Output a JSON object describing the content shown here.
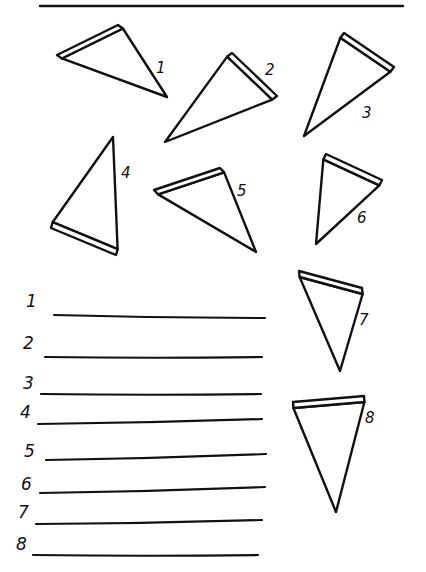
{
  "worksheet": {
    "header_line": {
      "x1": 40,
      "y1": 6,
      "x2": 403,
      "y2": 6
    },
    "ink_color": "#111111",
    "background_color": "#ffffff",
    "slices": [
      {
        "number": "1",
        "crust_a": [
          57,
          55
        ],
        "crust_b": [
          118,
          25
        ],
        "tip": [
          167,
          97
        ],
        "label_pos": [
          156,
          73
        ]
      },
      {
        "number": "2",
        "crust_a": [
          232,
          53
        ],
        "crust_b": [
          277,
          96
        ],
        "tip": [
          165,
          142
        ],
        "label_pos": [
          265,
          75
        ]
      },
      {
        "number": "3",
        "crust_a": [
          344,
          33
        ],
        "crust_b": [
          394,
          67
        ],
        "tip": [
          304,
          136
        ],
        "label_pos": [
          362,
          118
        ]
      },
      {
        "number": "4",
        "crust_a": [
          51,
          228
        ],
        "crust_b": [
          116,
          255
        ],
        "tip": [
          113,
          137
        ],
        "label_pos": [
          121,
          178
        ]
      },
      {
        "number": "5",
        "crust_a": [
          154,
          190
        ],
        "crust_b": [
          220,
          168
        ],
        "tip": [
          256,
          252
        ],
        "label_pos": [
          237,
          196
        ]
      },
      {
        "number": "6",
        "crust_a": [
          326,
          154
        ],
        "crust_b": [
          382,
          180
        ],
        "tip": [
          316,
          244
        ],
        "label_pos": [
          357,
          223
        ]
      },
      {
        "number": "7",
        "crust_a": [
          299,
          271
        ],
        "crust_b": [
          362,
          288
        ],
        "tip": [
          340,
          371
        ],
        "label_pos": [
          359,
          325
        ]
      },
      {
        "number": "8",
        "crust_a": [
          293,
          402
        ],
        "crust_b": [
          364,
          396
        ],
        "tip": [
          336,
          512
        ],
        "label_pos": [
          365,
          423
        ]
      }
    ],
    "answer_lines": [
      {
        "number": "1",
        "label_pos": [
          26,
          307
        ],
        "x1": 54,
        "y1": 315,
        "x2": 265,
        "y2": 318
      },
      {
        "number": "2",
        "label_pos": [
          23,
          349
        ],
        "x1": 45,
        "y1": 357,
        "x2": 262,
        "y2": 357
      },
      {
        "number": "3",
        "label_pos": [
          23,
          389
        ],
        "x1": 41,
        "y1": 394,
        "x2": 261,
        "y2": 394
      },
      {
        "number": "4",
        "label_pos": [
          20,
          418
        ],
        "x1": 38,
        "y1": 424,
        "x2": 262,
        "y2": 419
      },
      {
        "number": "5",
        "label_pos": [
          24,
          457
        ],
        "x1": 46,
        "y1": 460,
        "x2": 266,
        "y2": 454
      },
      {
        "number": "6",
        "label_pos": [
          21,
          490
        ],
        "x1": 40,
        "y1": 493,
        "x2": 265,
        "y2": 487
      },
      {
        "number": "7",
        "label_pos": [
          18,
          518
        ],
        "x1": 36,
        "y1": 524,
        "x2": 262,
        "y2": 520
      },
      {
        "number": "8",
        "label_pos": [
          16,
          550
        ],
        "x1": 33,
        "y1": 555,
        "x2": 258,
        "y2": 555
      }
    ]
  }
}
